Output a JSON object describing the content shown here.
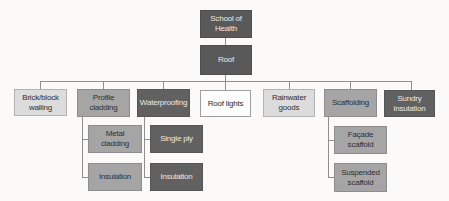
{
  "diagram": {
    "type": "org-chart",
    "nodes": {
      "school_of_health": {
        "label": "School of Health"
      },
      "roof": {
        "label": "Roof"
      },
      "brick_block_walling": {
        "label": "Brick/block walling"
      },
      "profile_cladding": {
        "label": "Profile cladding"
      },
      "waterproofing": {
        "label": "Waterproofing"
      },
      "roof_lights": {
        "label": "Roof lights"
      },
      "rainwater_goods": {
        "label": "Rainwater goods"
      },
      "scaffolding": {
        "label": "Scaffolding"
      },
      "sundry_insulation": {
        "label": "Sundry insulation"
      },
      "metal_cladding": {
        "label": "Metal cladding"
      },
      "single_ply": {
        "label": "Single ply"
      },
      "insulation_under_cladding": {
        "label": "Insulation"
      },
      "insulation_under_waterproofing": {
        "label": "Insulation"
      },
      "facade_scaffold": {
        "label": "Façade scaffold"
      },
      "suspended_scaffold": {
        "label": "Suspended scaffold"
      }
    },
    "hierarchy": {
      "root": "School of Health",
      "tree": {
        "node": "School of Health",
        "children": [
          {
            "node": "Roof",
            "children": [
              {
                "node": "Brick/block walling",
                "children": []
              },
              {
                "node": "Profile cladding",
                "children": [
                  {
                    "node": "Metal cladding"
                  },
                  {
                    "node": "Insulation"
                  }
                ]
              },
              {
                "node": "Waterproofing",
                "children": [
                  {
                    "node": "Single ply"
                  },
                  {
                    "node": "Insulation"
                  }
                ]
              },
              {
                "node": "Roof lights",
                "children": []
              },
              {
                "node": "Rainwater goods",
                "children": []
              },
              {
                "node": "Scaffolding",
                "children": [
                  {
                    "node": "Façade scaffold"
                  },
                  {
                    "node": "Suspended scaffold"
                  }
                ]
              },
              {
                "node": "Sundry insulation",
                "children": []
              }
            ]
          }
        ]
      }
    },
    "colors": {
      "dark_box": "#616161",
      "darker_box": "#595959",
      "medium_box": "#a5a5a5",
      "light_box": "#dcdcdc",
      "white_box": "#fdfdfd",
      "dark_text": "#2f2f2f",
      "light_text": "#e9e9e9",
      "connector_line": "#8f8f8f",
      "background": "#fbfaf8"
    }
  }
}
